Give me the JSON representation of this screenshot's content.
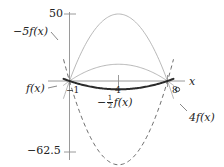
{
  "figure": {
    "kind": "math-graph",
    "background": "#ffffff",
    "axis_color": "#8a8a8a"
  },
  "axes": {
    "x_axis_label": "x",
    "y_ticks": [
      {
        "label": "50",
        "value": 50
      },
      {
        "label": "−62.5",
        "value": -62.5
      }
    ],
    "x_ticks": [
      {
        "label": "−1",
        "value": -1
      },
      {
        "label": "4",
        "value": 4
      },
      {
        "label": "8",
        "value": 8
      }
    ]
  },
  "annotations": {
    "f": "f(x)",
    "four_f": "4f(x)",
    "minus_five_f": "−5f(x)",
    "minus_half_f_prefix": "−",
    "minus_half_f_num": "1",
    "minus_half_f_den": "2",
    "minus_half_f_suffix": "f(x)"
  },
  "chart_data": {
    "type": "line",
    "title": "",
    "xlabel": "x",
    "ylabel": "",
    "xlim": [
      -2.2,
      9.6
    ],
    "ylim": [
      -70,
      58
    ],
    "grid": false,
    "legend": "inline-annotations",
    "base_function": "f(x) = -0.6173(x+1)(x-8)",
    "roots": [
      -1,
      8
    ],
    "vertex_x": 3.5,
    "series": [
      {
        "name": "f(x)",
        "scale": 1,
        "style": "thin-solid",
        "color": "#9a9a9a",
        "width": 0.7,
        "peak_value": 12.5,
        "x": [
          -1,
          0,
          1,
          2,
          3,
          3.5,
          4,
          5,
          6,
          7,
          8
        ],
        "y": [
          0,
          4.94,
          8.64,
          11.11,
          12.35,
          12.5,
          12.35,
          11.11,
          8.64,
          4.94,
          0
        ]
      },
      {
        "name": "−½f(x)",
        "scale": -0.5,
        "style": "bold-solid",
        "color": "#2b2b2b",
        "width": 2.0,
        "peak_value": -6.25,
        "x": [
          -1,
          0,
          1,
          2,
          3,
          3.5,
          4,
          5,
          6,
          7,
          8
        ],
        "y": [
          0,
          -2.47,
          -4.32,
          -5.56,
          -6.17,
          -6.25,
          -6.17,
          -5.56,
          -4.32,
          -2.47,
          0
        ]
      },
      {
        "name": "4f(x)",
        "scale": 4,
        "style": "thin-solid",
        "color": "#a6a6a6",
        "width": 0.8,
        "peak_value": 50,
        "x": [
          -1,
          0,
          1,
          2,
          3,
          3.5,
          4,
          5,
          6,
          7,
          8
        ],
        "y": [
          0,
          19.75,
          34.57,
          44.44,
          49.38,
          50,
          49.38,
          44.44,
          34.57,
          19.75,
          0
        ]
      },
      {
        "name": "−5f(x)",
        "scale": -5,
        "style": "dashed",
        "color": "#6e6e6e",
        "width": 1.0,
        "peak_value": -62.5,
        "x": [
          -1,
          0,
          1,
          2,
          3,
          3.5,
          4,
          5,
          6,
          7,
          8
        ],
        "y": [
          0,
          -24.69,
          -43.21,
          -55.56,
          -61.73,
          -62.5,
          -61.73,
          -55.56,
          -43.21,
          -24.69,
          0
        ]
      }
    ]
  }
}
